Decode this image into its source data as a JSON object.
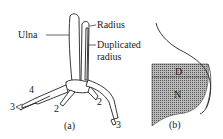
{
  "panel_a": {
    "caption": "(a)",
    "labels": {
      "ulna": "Ulna",
      "radius": "Radius",
      "duplicated_radius_line1": "Duplicated",
      "duplicated_radius_line2": "radius"
    },
    "digit_numbers": [
      "4",
      "3",
      "2",
      "2",
      "3"
    ]
  },
  "panel_b": {
    "caption": "(b)",
    "regions": {
      "dorsal": "D",
      "ventral": "N"
    }
  },
  "colors": {
    "ink": "#222222",
    "hatch_fill": "#888888",
    "background": "#ffffff"
  }
}
